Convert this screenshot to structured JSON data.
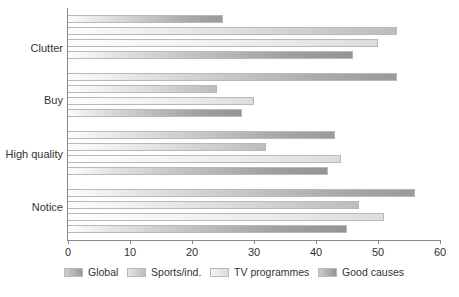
{
  "chart_data": {
    "type": "bar",
    "orientation": "horizontal",
    "title": "",
    "xlabel": "",
    "ylabel": "",
    "xlim": [
      0,
      60
    ],
    "ylim": null,
    "grid": false,
    "legend_position": "bottom",
    "categories": [
      "Clutter",
      "Buy",
      "High quality",
      "Notice"
    ],
    "series": [
      {
        "name": "Global",
        "color": "#9a9a9a",
        "values": [
          25,
          53,
          43,
          56
        ]
      },
      {
        "name": "Sports/ind.",
        "color": "#bdbdbd",
        "values": [
          53,
          24,
          32,
          47
        ]
      },
      {
        "name": "TV programmes",
        "color": "#dcdcdc",
        "values": [
          50,
          30,
          44,
          51
        ]
      },
      {
        "name": "Good causes",
        "color": "#949494",
        "values": [
          46,
          28,
          42,
          45
        ]
      }
    ],
    "xticks": [
      0,
      10,
      20,
      30,
      40,
      50,
      60
    ],
    "xtick_labels": [
      "0",
      "10",
      "20",
      "30",
      "40",
      "50",
      "60"
    ]
  },
  "legend": {
    "items": [
      {
        "label": "Global"
      },
      {
        "label": "Sports/ind."
      },
      {
        "label": "TV programmes"
      },
      {
        "label": "Good causes"
      }
    ]
  }
}
